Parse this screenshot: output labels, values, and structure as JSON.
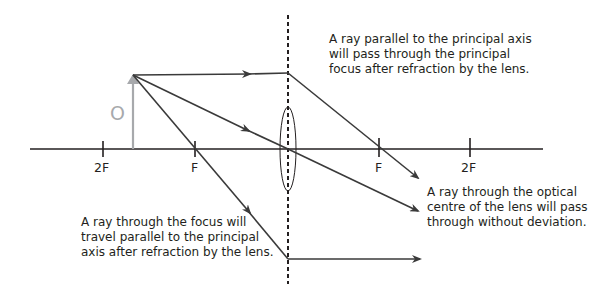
{
  "diagram": {
    "object_label": "O",
    "axis_labels": {
      "left_2f": "2F",
      "left_f": "F",
      "right_f": "F",
      "right_2f": "2F"
    },
    "annotations": {
      "parallel_ray": [
        "A ray parallel to the principal axis",
        "will pass through the principal",
        "focus after refraction by the lens."
      ],
      "centre_ray": [
        "A ray through the optical",
        "centre of the lens will pass",
        "through without deviation."
      ],
      "focus_ray": [
        "A ray through the focus will",
        "travel parallel to the principal",
        "axis after refraction by the lens."
      ]
    },
    "colors": {
      "ray": "#3a3a3a",
      "axis": "#231f20",
      "object": "#a7a9ac",
      "background": "#ffffff"
    }
  }
}
